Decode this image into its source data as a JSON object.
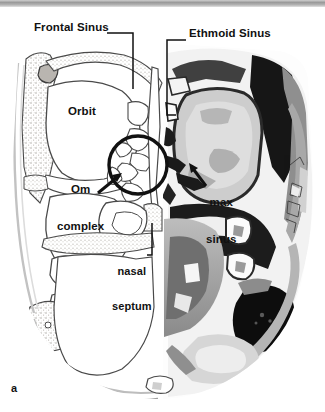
{
  "figure": {
    "panel_letter": "a",
    "labels": [
      {
        "id": "frontal_sinus",
        "text": "Frontal Sinus"
      },
      {
        "id": "ethmoid_sinus",
        "text": "Ethmoid Sinus"
      },
      {
        "id": "orbit",
        "text": "Orbit"
      },
      {
        "id": "om_complex_1",
        "text": "Om"
      },
      {
        "id": "om_complex_2",
        "text": "complex"
      },
      {
        "id": "max_sinus_1",
        "text": "max"
      },
      {
        "id": "max_sinus_2",
        "text": "sinus"
      },
      {
        "id": "nasal_septum_1",
        "text": "nasal"
      },
      {
        "id": "nasal_septum_2",
        "text": "septum"
      }
    ],
    "colors": {
      "background": "#ffffff",
      "ink": "#111111",
      "line_art": "#4a4a4a",
      "bone_stipple": "#b8b4ae",
      "soft_tissue_mid": "#8d8d8d",
      "soft_tissue_light": "#c9c9c9",
      "air_dark": "#1a1a1a",
      "topbar": "#9a9a9a"
    }
  }
}
